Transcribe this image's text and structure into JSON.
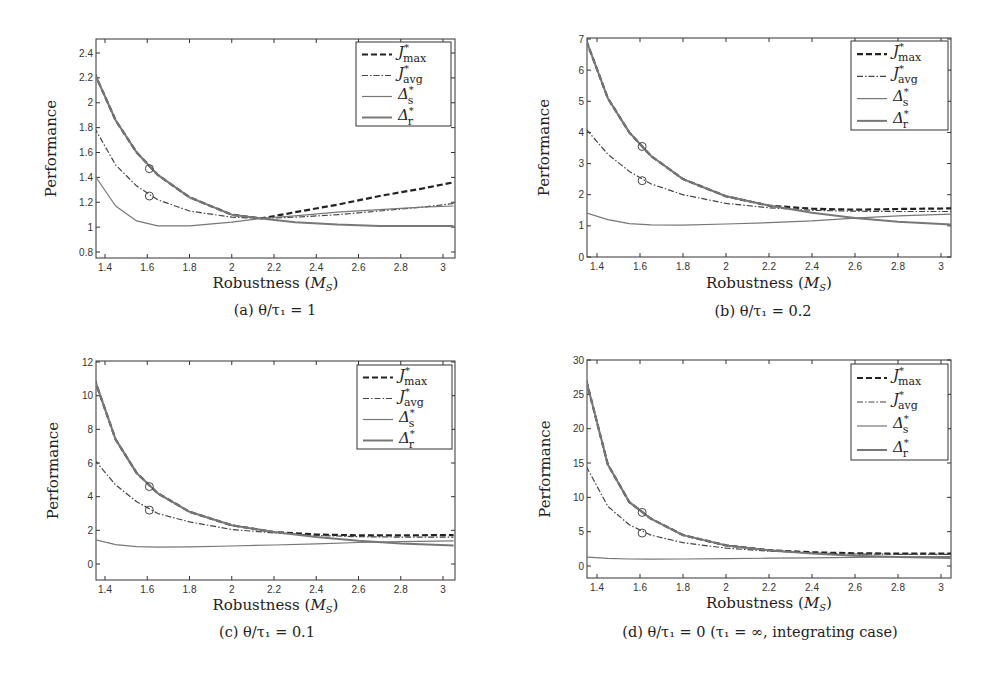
{
  "figure": {
    "panels": [
      {
        "id": "a",
        "caption": "(a) θ/τ₁ = 1"
      },
      {
        "id": "b",
        "caption": "(b) θ/τ₁ = 0.2"
      },
      {
        "id": "c",
        "caption": "(c) θ/τ₁ = 0.1"
      },
      {
        "id": "d",
        "caption": "(d) θ/τ₁ = 0 (τ₁ = ∞, integrating case)"
      }
    ]
  },
  "chart_data": [
    {
      "type": "line",
      "title": "(a) θ/τ1 = 1",
      "xlabel": "Robustness (M_S)",
      "ylabel": "Performance",
      "xlim": [
        1.35,
        3.05
      ],
      "ylim": [
        0.75,
        2.5
      ],
      "xticks": [
        "1.4",
        "1.6",
        "1.8",
        "2",
        "2.2",
        "2.4",
        "2.6",
        "2.8",
        "3"
      ],
      "yticks": [
        "0.8",
        "1",
        "1.2",
        "1.4",
        "1.6",
        "1.8",
        "2",
        "2.2",
        "2.4"
      ],
      "legend": [
        "J*max",
        "J*avg",
        "Δ*s",
        "Δ*r"
      ],
      "legend_position": "upper right",
      "markers": [
        {
          "x": 1.61,
          "y": 1.47
        },
        {
          "x": 1.61,
          "y": 1.25
        }
      ],
      "x": [
        1.35,
        1.45,
        1.55,
        1.65,
        1.8,
        2.0,
        2.14,
        2.3,
        2.5,
        2.7,
        2.9,
        3.05
      ],
      "series": [
        {
          "name": "J*max",
          "style": "dashed",
          "values": [
            2.24,
            1.86,
            1.6,
            1.42,
            1.24,
            1.1,
            1.07,
            1.12,
            1.18,
            1.25,
            1.31,
            1.36
          ]
        },
        {
          "name": "J*avg",
          "style": "dashdot",
          "values": [
            1.8,
            1.5,
            1.33,
            1.22,
            1.13,
            1.08,
            1.07,
            1.08,
            1.1,
            1.13,
            1.16,
            1.19
          ]
        },
        {
          "name": "Δ*s",
          "style": "solid",
          "values": [
            1.42,
            1.17,
            1.05,
            1.01,
            1.01,
            1.04,
            1.07,
            1.09,
            1.12,
            1.14,
            1.16,
            1.17
          ]
        },
        {
          "name": "Δ*r",
          "style": "solid",
          "values": [
            2.24,
            1.86,
            1.6,
            1.42,
            1.24,
            1.1,
            1.07,
            1.04,
            1.02,
            1.01,
            1.01,
            1.01
          ]
        }
      ]
    },
    {
      "type": "line",
      "title": "(b) θ/τ1 = 0.2",
      "xlabel": "Robustness (M_S)",
      "ylabel": "Performance",
      "xlim": [
        1.35,
        3.05
      ],
      "ylim": [
        0,
        7
      ],
      "xticks": [
        "1.4",
        "1.6",
        "1.8",
        "2",
        "2.2",
        "2.4",
        "2.6",
        "2.8",
        "3"
      ],
      "yticks": [
        "0",
        "1",
        "2",
        "3",
        "4",
        "5",
        "6",
        "7"
      ],
      "legend": [
        "J*max",
        "J*avg",
        "Δ*s",
        "Δ*r"
      ],
      "legend_position": "upper right",
      "markers": [
        {
          "x": 1.61,
          "y": 3.55
        },
        {
          "x": 1.61,
          "y": 2.45
        }
      ],
      "x": [
        1.35,
        1.45,
        1.55,
        1.65,
        1.8,
        2.0,
        2.2,
        2.4,
        2.6,
        2.8,
        3.05
      ],
      "series": [
        {
          "name": "J*max",
          "style": "dashed",
          "values": [
            6.95,
            5.1,
            4.0,
            3.25,
            2.5,
            1.95,
            1.65,
            1.55,
            1.52,
            1.54,
            1.56
          ]
        },
        {
          "name": "J*avg",
          "style": "dashdot",
          "values": [
            4.1,
            3.3,
            2.75,
            2.35,
            2.0,
            1.72,
            1.58,
            1.5,
            1.47,
            1.46,
            1.46
          ]
        },
        {
          "name": "Δ*s",
          "style": "solid",
          "values": [
            1.42,
            1.2,
            1.07,
            1.03,
            1.02,
            1.06,
            1.1,
            1.16,
            1.25,
            1.32,
            1.38
          ]
        },
        {
          "name": "Δ*r",
          "style": "solid",
          "values": [
            6.95,
            5.1,
            4.0,
            3.25,
            2.5,
            1.95,
            1.65,
            1.42,
            1.25,
            1.13,
            1.04
          ]
        }
      ]
    },
    {
      "type": "line",
      "title": "(c) θ/τ1 = 0.1",
      "xlabel": "Robustness (M_S)",
      "ylabel": "Performance",
      "xlim": [
        1.35,
        3.05
      ],
      "ylim": [
        -1,
        12
      ],
      "xticks": [
        "1.4",
        "1.6",
        "1.8",
        "2",
        "2.2",
        "2.4",
        "2.6",
        "2.8",
        "3"
      ],
      "yticks": [
        "0",
        "2",
        "4",
        "6",
        "8",
        "10",
        "12"
      ],
      "legend": [
        "J*max",
        "J*avg",
        "Δ*s",
        "Δ*r"
      ],
      "legend_position": "upper right",
      "markers": [
        {
          "x": 1.61,
          "y": 4.6
        },
        {
          "x": 1.61,
          "y": 3.2
        }
      ],
      "x": [
        1.35,
        1.45,
        1.55,
        1.65,
        1.8,
        2.0,
        2.2,
        2.4,
        2.6,
        2.8,
        3.05
      ],
      "series": [
        {
          "name": "J*max",
          "style": "dashed",
          "values": [
            11.0,
            7.4,
            5.4,
            4.2,
            3.1,
            2.3,
            1.9,
            1.75,
            1.7,
            1.7,
            1.72
          ]
        },
        {
          "name": "J*avg",
          "style": "dashdot",
          "values": [
            6.2,
            4.7,
            3.7,
            3.0,
            2.5,
            2.05,
            1.85,
            1.7,
            1.62,
            1.6,
            1.6
          ]
        },
        {
          "name": "Δ*s",
          "style": "solid",
          "values": [
            1.45,
            1.15,
            1.03,
            1.0,
            1.02,
            1.07,
            1.13,
            1.2,
            1.28,
            1.33,
            1.38
          ]
        },
        {
          "name": "Δ*r",
          "style": "solid",
          "values": [
            11.0,
            7.4,
            5.4,
            4.2,
            3.1,
            2.3,
            1.9,
            1.6,
            1.38,
            1.22,
            1.1
          ]
        }
      ]
    },
    {
      "type": "line",
      "title": "(d) θ/τ1 = 0 (τ1 = ∞, integrating case)",
      "xlabel": "Robustness (M_S)",
      "ylabel": "Performance",
      "xlim": [
        1.35,
        3.05
      ],
      "ylim": [
        -2,
        30
      ],
      "xticks": [
        "1.4",
        "1.6",
        "1.8",
        "2",
        "2.2",
        "2.4",
        "2.6",
        "2.8",
        "3"
      ],
      "yticks": [
        "0",
        "5",
        "10",
        "15",
        "20",
        "25",
        "30"
      ],
      "legend": [
        "J*max",
        "J*avg",
        "Δ*s",
        "Δ*r"
      ],
      "legend_position": "upper right",
      "markers": [
        {
          "x": 1.61,
          "y": 7.8
        },
        {
          "x": 1.61,
          "y": 4.8
        }
      ],
      "x": [
        1.35,
        1.45,
        1.55,
        1.65,
        1.8,
        2.0,
        2.2,
        2.4,
        2.6,
        2.8,
        3.05
      ],
      "series": [
        {
          "name": "J*max",
          "style": "dashed",
          "values": [
            27.0,
            14.8,
            9.3,
            6.9,
            4.5,
            3.0,
            2.3,
            2.0,
            1.85,
            1.8,
            1.8
          ]
        },
        {
          "name": "J*avg",
          "style": "dashdot",
          "values": [
            14.5,
            8.7,
            6.0,
            4.5,
            3.4,
            2.6,
            2.15,
            1.9,
            1.75,
            1.7,
            1.7
          ]
        },
        {
          "name": "Δ*s",
          "style": "solid",
          "values": [
            1.3,
            1.1,
            1.02,
            1.0,
            1.02,
            1.07,
            1.13,
            1.2,
            1.27,
            1.33,
            1.38
          ]
        },
        {
          "name": "Δ*r",
          "style": "solid",
          "values": [
            27.0,
            14.8,
            9.3,
            6.9,
            4.5,
            3.0,
            2.3,
            1.8,
            1.5,
            1.3,
            1.15
          ]
        }
      ]
    }
  ],
  "layout": {
    "panels": [
      {
        "left": 96,
        "right": 455,
        "top": 39,
        "bottom": 258,
        "xpx": [
          105,
          443
        ],
        "ycal": [
          [
            0.8,
            252
          ],
          [
            2.4,
            53
          ]
        ],
        "ylabel_x": 56,
        "xlabel_y": 288,
        "caption_y": 315,
        "caption_x": 275,
        "legend": {
          "x": 356,
          "y": 42,
          "w": 95,
          "h": 84
        }
      },
      {
        "left": 587,
        "right": 951,
        "top": 38,
        "bottom": 257,
        "xpx": [
          597,
          941
        ],
        "ycal": [
          [
            0,
            257
          ],
          [
            7,
            39
          ]
        ],
        "ylabel_x": 549,
        "xlabel_y": 288,
        "caption_y": 316,
        "caption_x": 763,
        "legend": {
          "x": 851,
          "y": 41,
          "w": 97,
          "h": 89
        }
      },
      {
        "left": 96,
        "right": 455,
        "top": 361,
        "bottom": 580,
        "xpx": [
          105,
          443
        ],
        "ycal": [
          [
            0,
            564
          ],
          [
            12,
            362
          ]
        ],
        "ylabel_x": 58,
        "xlabel_y": 610,
        "caption_y": 637,
        "caption_x": 267,
        "legend": {
          "x": 357,
          "y": 365,
          "w": 95,
          "h": 84
        }
      },
      {
        "left": 587,
        "right": 951,
        "top": 360,
        "bottom": 578,
        "xpx": [
          597,
          941
        ],
        "ycal": [
          [
            0,
            566
          ],
          [
            30,
            360
          ]
        ],
        "ylabel_x": 550,
        "xlabel_y": 608,
        "caption_y": 637,
        "caption_x": 760,
        "legend": {
          "x": 851,
          "y": 364,
          "w": 97,
          "h": 96
        }
      }
    ]
  }
}
